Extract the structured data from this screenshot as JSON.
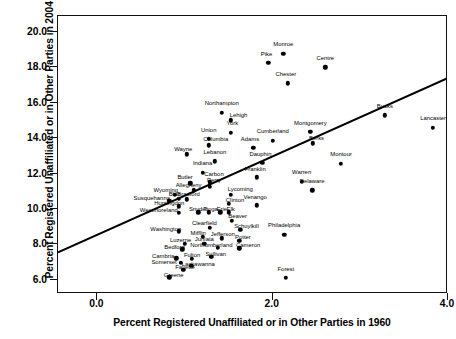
{
  "chart_data": {
    "type": "scatter",
    "title": "",
    "xlabel": "Percent Registered Unaffiliated or in Other Parties in 1960",
    "ylabel": "Percent Registered Unaffiliated or in Other Parties in 2004",
    "xlim": [
      -0.45,
      4.0
    ],
    "ylim": [
      5.2,
      20.9
    ],
    "xticks": [
      0.0,
      2.0,
      4.0
    ],
    "xtick_labels": [
      "0.0",
      "2.0",
      "4.0"
    ],
    "yticks": [
      6.0,
      8.0,
      10.0,
      12.0,
      14.0,
      16.0,
      18.0,
      20.0
    ],
    "ytick_labels": [
      "6.0",
      "8.0",
      "10.0",
      "12.0",
      "14.0",
      "16.0",
      "18.0",
      "20.0"
    ],
    "grid": false,
    "legend": null,
    "point_label_key": "county",
    "trendline": {
      "type": "linear-fit",
      "x_start": -0.45,
      "y_start": 7.55,
      "x_end": 4.0,
      "y_end": 17.4
    },
    "points": [
      {
        "county": "Monroe",
        "x": 2.12,
        "y": 18.75,
        "lx": 2.12,
        "ly": 19.3
      },
      {
        "county": "Pike",
        "x": 1.95,
        "y": 18.25,
        "lx": 1.93,
        "ly": 18.78
      },
      {
        "county": "Chester",
        "x": 2.17,
        "y": 17.1,
        "lx": 2.15,
        "ly": 17.62
      },
      {
        "county": "Centre",
        "x": 2.6,
        "y": 18.0,
        "lx": 2.6,
        "ly": 18.55
      },
      {
        "county": "Northampton",
        "x": 1.42,
        "y": 15.45,
        "lx": 1.42,
        "ly": 16.0
      },
      {
        "county": "Lehigh",
        "x": 1.52,
        "y": 15.0,
        "lx": 1.61,
        "ly": 15.33
      },
      {
        "county": "York",
        "x": 1.52,
        "y": 14.3,
        "lx": 1.54,
        "ly": 14.83
      },
      {
        "county": "Bucks",
        "x": 3.28,
        "y": 15.3,
        "lx": 3.28,
        "ly": 15.83
      },
      {
        "county": "Lancaster",
        "x": 3.83,
        "y": 14.6,
        "lx": 3.83,
        "ly": 15.14
      },
      {
        "county": "Union",
        "x": 1.27,
        "y": 13.95,
        "lx": 1.27,
        "ly": 14.48
      },
      {
        "county": "Columbia",
        "x": 1.27,
        "y": 13.6,
        "lx": 1.35,
        "ly": 13.93
      },
      {
        "county": "Wayne",
        "x": 1.02,
        "y": 13.1,
        "lx": 0.98,
        "ly": 13.4
      },
      {
        "county": "Lebanon",
        "x": 1.34,
        "y": 12.7,
        "lx": 1.34,
        "ly": 13.23
      },
      {
        "county": "Adams",
        "x": 1.78,
        "y": 13.45,
        "lx": 1.74,
        "ly": 13.94
      },
      {
        "county": "Cumberland",
        "x": 2.0,
        "y": 13.85,
        "lx": 2.0,
        "ly": 14.38
      },
      {
        "county": "Montgomery",
        "x": 2.43,
        "y": 14.35,
        "lx": 2.43,
        "ly": 14.88
      },
      {
        "county": "Berks",
        "x": 2.46,
        "y": 13.7,
        "lx": 2.5,
        "ly": 14.02
      },
      {
        "county": "Dauphin",
        "x": 1.88,
        "y": 12.6,
        "lx": 1.86,
        "ly": 13.12
      },
      {
        "county": "Franklin",
        "x": 1.82,
        "y": 11.8,
        "lx": 1.8,
        "ly": 12.25
      },
      {
        "county": "Montour",
        "x": 2.78,
        "y": 12.55,
        "lx": 2.78,
        "ly": 13.08
      },
      {
        "county": "Warren",
        "x": 2.33,
        "y": 11.55,
        "lx": 2.33,
        "ly": 12.08
      },
      {
        "county": "Delaware",
        "x": 2.45,
        "y": 11.05,
        "lx": 2.45,
        "ly": 11.58
      },
      {
        "county": "Indiana",
        "x": 1.2,
        "y": 12.05,
        "lx": 1.2,
        "ly": 12.58
      },
      {
        "county": "Carbon",
        "x": 1.28,
        "y": 11.5,
        "lx": 1.33,
        "ly": 11.95
      },
      {
        "county": "Perry",
        "x": 1.28,
        "y": 11.25,
        "lx": 1.33,
        "ly": 11.62
      },
      {
        "county": "Butler",
        "x": 1.06,
        "y": 11.45,
        "lx": 1.0,
        "ly": 11.82
      },
      {
        "county": "Allegheny",
        "x": 1.1,
        "y": 11.05,
        "lx": 1.04,
        "ly": 11.35
      },
      {
        "county": "Lycoming",
        "x": 1.52,
        "y": 10.8,
        "lx": 1.63,
        "ly": 11.12
      },
      {
        "county": "Wyoming",
        "x": 0.88,
        "y": 10.8,
        "lx": 0.78,
        "ly": 11.1
      },
      {
        "county": "Bradford",
        "x": 1.02,
        "y": 10.55,
        "lx": 1.04,
        "ly": 10.82
      },
      {
        "county": "Blair",
        "x": 0.93,
        "y": 10.58,
        "lx": 0.88,
        "ly": 10.85
      },
      {
        "county": "Susquehanna",
        "x": 0.82,
        "y": 10.45,
        "lx": 0.62,
        "ly": 10.6
      },
      {
        "county": "Clinton",
        "x": 1.5,
        "y": 10.3,
        "lx": 1.57,
        "ly": 10.52
      },
      {
        "county": "Huntingdon",
        "x": 0.93,
        "y": 10.15,
        "lx": 0.82,
        "ly": 10.33
      },
      {
        "county": "Snyder",
        "x": 1.15,
        "y": 9.82,
        "lx": 1.15,
        "ly": 10.0
      },
      {
        "county": "Tioga",
        "x": 1.27,
        "y": 9.82,
        "lx": 1.29,
        "ly": 10.02
      },
      {
        "county": "Erie",
        "x": 1.4,
        "y": 9.82,
        "lx": 1.42,
        "ly": 10.02
      },
      {
        "county": "Elk",
        "x": 1.5,
        "y": 9.82,
        "lx": 1.52,
        "ly": 10.02
      },
      {
        "county": "Westmoreland",
        "x": 0.93,
        "y": 9.78,
        "lx": 0.7,
        "ly": 9.92
      },
      {
        "county": "Beaver",
        "x": 1.53,
        "y": 9.35,
        "lx": 1.6,
        "ly": 9.6
      },
      {
        "county": "Clearfield",
        "x": 1.28,
        "y": 8.95,
        "lx": 1.22,
        "ly": 9.2
      },
      {
        "county": "Schuylkill",
        "x": 1.63,
        "y": 8.82,
        "lx": 1.7,
        "ly": 9.05
      },
      {
        "county": "Washington",
        "x": 0.93,
        "y": 8.75,
        "lx": 0.78,
        "ly": 8.88
      },
      {
        "county": "Mifflin",
        "x": 1.2,
        "y": 8.42,
        "lx": 1.15,
        "ly": 8.62
      },
      {
        "county": "Jefferson",
        "x": 1.42,
        "y": 8.35,
        "lx": 1.43,
        "ly": 8.58
      },
      {
        "county": "Potter",
        "x": 1.62,
        "y": 8.2,
        "lx": 1.66,
        "ly": 8.42
      },
      {
        "county": "Juniata",
        "x": 1.22,
        "y": 8.05,
        "lx": 1.22,
        "ly": 8.28
      },
      {
        "county": "Luzerne",
        "x": 1.0,
        "y": 8.02,
        "lx": 0.95,
        "ly": 8.25
      },
      {
        "county": "Northumberland",
        "x": 1.37,
        "y": 7.82,
        "lx": 1.3,
        "ly": 7.98
      },
      {
        "county": "Cameron",
        "x": 1.62,
        "y": 7.78,
        "lx": 1.72,
        "ly": 7.95
      },
      {
        "county": "Bedford",
        "x": 0.97,
        "y": 7.72,
        "lx": 0.88,
        "ly": 7.88
      },
      {
        "county": "Sullivan",
        "x": 1.3,
        "y": 7.3,
        "lx": 1.35,
        "ly": 7.48
      },
      {
        "county": "Fulton",
        "x": 1.08,
        "y": 7.18,
        "lx": 1.08,
        "ly": 7.38
      },
      {
        "county": "Cambria",
        "x": 0.9,
        "y": 7.22,
        "lx": 0.75,
        "ly": 7.35
      },
      {
        "county": "Somerset",
        "x": 0.95,
        "y": 6.95,
        "lx": 0.76,
        "ly": 7.02
      },
      {
        "county": "Lackawanna",
        "x": 1.07,
        "y": 6.8,
        "lx": 1.15,
        "ly": 6.9
      },
      {
        "county": "Fayette",
        "x": 0.98,
        "y": 6.55,
        "lx": 1.0,
        "ly": 6.7
      },
      {
        "county": "Greene",
        "x": 0.82,
        "y": 6.15,
        "lx": 0.87,
        "ly": 6.3
      },
      {
        "county": "Venango",
        "x": 1.82,
        "y": 10.2,
        "lx": 1.8,
        "ly": 10.68
      },
      {
        "county": "Philadelphia",
        "x": 2.13,
        "y": 8.55,
        "lx": 2.13,
        "ly": 9.08
      },
      {
        "county": "Forest",
        "x": 2.15,
        "y": 6.1,
        "lx": 2.15,
        "ly": 6.62
      }
    ]
  }
}
